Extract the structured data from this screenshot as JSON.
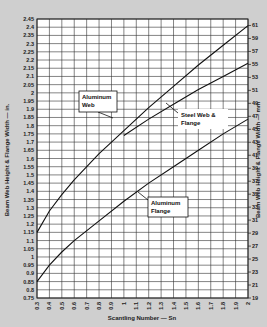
{
  "chart_data": {
    "type": "line",
    "title": "",
    "xlabel": "Scantling Number — Sn",
    "ylabel": "Beam Web Height & Flange Width — in.",
    "y2label": "Beam Web Height & Flange Width — mm",
    "xlim": [
      0.3,
      2.0
    ],
    "ylim": [
      0.75,
      2.45
    ],
    "y2lim": [
      19,
      62
    ],
    "grid": true,
    "x_ticks": [
      "0.3",
      "0.4",
      "0.5",
      "0.6",
      "0.7",
      "0.8",
      "0.9",
      "1",
      "1.1",
      "1.2",
      "1.3",
      "1.4",
      "1.5",
      "1.6",
      "1.7",
      "1.8",
      "1.9",
      "2"
    ],
    "y_ticks": [
      "2.45",
      "2.4",
      "2.35",
      "2.3",
      "2.25",
      "2.2",
      "2.15",
      "2.1",
      "2.05",
      "2",
      "1.95",
      "1.9",
      "1.85",
      "1.8",
      "1.75",
      "1.7",
      "1.65",
      "1.6",
      "1.55",
      "1.5",
      "1.45",
      "1.4",
      "1.35",
      "1.3",
      "1.25",
      "1.2",
      "1.15",
      "1.1",
      "1.05",
      "1",
      "0.95",
      "0.9",
      "0.85",
      "0.8",
      "0.75"
    ],
    "y2_ticks": [
      "61",
      "59",
      "57",
      "55",
      "53",
      "51",
      "49",
      "47",
      "45",
      "43",
      "41",
      "39",
      "37",
      "35",
      "33",
      "31",
      "29",
      "27",
      "25",
      "23",
      "21",
      "19"
    ],
    "series": [
      {
        "name": "Aluminum Web",
        "x": [
          0.3,
          0.4,
          0.5,
          0.6,
          0.8,
          1.0,
          1.2,
          1.4,
          1.6,
          1.8,
          2.0
        ],
        "y": [
          1.15,
          1.28,
          1.38,
          1.47,
          1.63,
          1.77,
          1.91,
          2.04,
          2.17,
          2.29,
          2.41
        ]
      },
      {
        "name": "Steel Web & Flange",
        "x": [
          1.0,
          1.2,
          1.4,
          1.6,
          1.8,
          2.0
        ],
        "y": [
          1.74,
          1.84,
          1.93,
          2.02,
          2.1,
          2.18
        ]
      },
      {
        "name": "Aluminum Flange",
        "x": [
          0.3,
          0.4,
          0.5,
          0.6,
          0.8,
          1.0,
          1.2,
          1.4,
          1.6,
          1.8,
          2.0
        ],
        "y": [
          0.85,
          0.95,
          1.03,
          1.1,
          1.22,
          1.34,
          1.45,
          1.55,
          1.65,
          1.75,
          1.84
        ]
      }
    ],
    "annotations": [
      {
        "text": [
          "Aluminum",
          "Web"
        ],
        "series": "Aluminum Web"
      },
      {
        "text": [
          "Steel Web &",
          "Flange"
        ],
        "series": "Steel Web & Flange"
      },
      {
        "text": [
          "Aluminum",
          "Flange"
        ],
        "series": "Aluminum Flange"
      }
    ]
  }
}
